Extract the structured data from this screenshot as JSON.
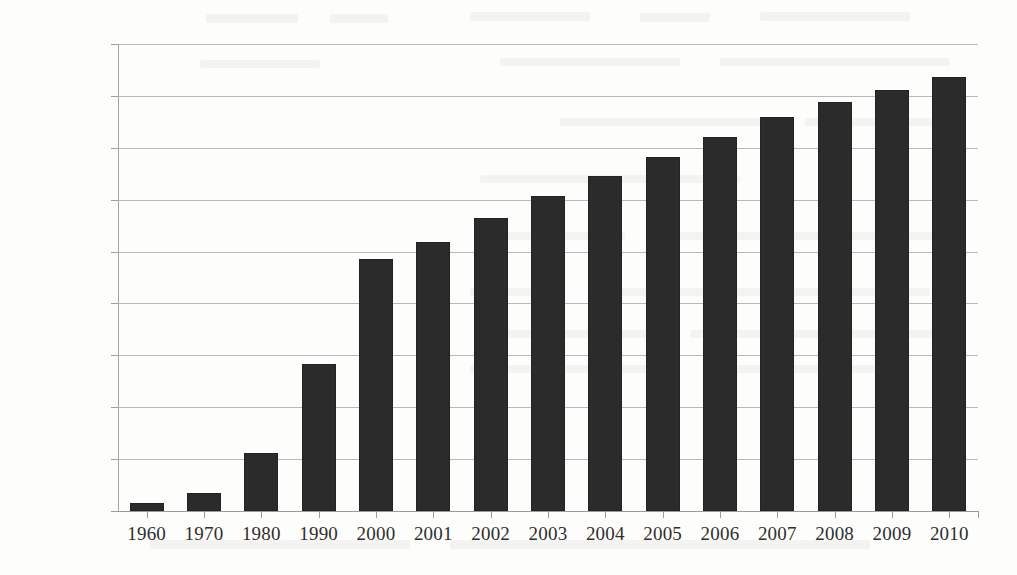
{
  "chart_data": {
    "type": "bar",
    "title": "",
    "subtitle": "",
    "xlabel": "",
    "ylabel": "",
    "categories": [
      "1960",
      "1970",
      "1980",
      "1990",
      "2000",
      "2001",
      "2002",
      "2003",
      "2004",
      "2005",
      "2006",
      "2007",
      "2008",
      "2009",
      "2010"
    ],
    "values": [
      148,
      356,
      1110,
      2825,
      4855,
      5190,
      5640,
      6080,
      6450,
      6820,
      7200,
      7590,
      7890,
      8110,
      8365
    ],
    "ylim": [
      0,
      9000
    ],
    "ytick_values": [
      0,
      1000,
      2000,
      3000,
      4000,
      5000,
      6000,
      7000,
      8000,
      9000
    ],
    "ytick_labels": [
      "$-",
      "$1,000",
      "$2,000",
      "$3,000",
      "$4,000",
      "$5,000",
      "$6,000",
      "$7,000",
      "$8,000",
      "$9,000"
    ],
    "grid": true,
    "legend": false,
    "legend_position": "none",
    "series": [
      {
        "name": "",
        "color": "#2b2b2b",
        "values": [
          148,
          356,
          1110,
          2825,
          4855,
          5190,
          5640,
          6080,
          6450,
          6820,
          7200,
          7590,
          7890,
          8110,
          8365
        ]
      }
    ]
  },
  "style": {
    "background": "#fdfdfc",
    "bar_color": "#2b2b2b",
    "grid_color": "#b9b9b9",
    "axis_color": "#9c9c9c",
    "text_color": "#2f2f2f"
  }
}
